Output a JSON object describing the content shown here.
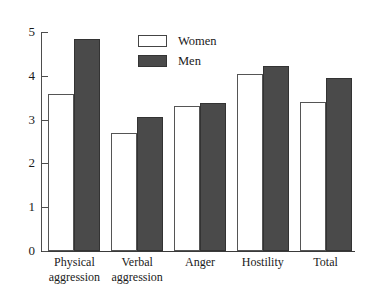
{
  "chart_data": {
    "type": "bar",
    "title": "",
    "xlabel": "",
    "ylabel": "",
    "ylim": [
      0,
      5
    ],
    "yticks": [
      "0",
      "1",
      "2",
      "3",
      "4",
      "5"
    ],
    "grid": false,
    "legend_position": "top-center",
    "categories": [
      "Physical aggression",
      "Verbal aggression",
      "Anger",
      "Hostility",
      "Total"
    ],
    "category_lines": [
      [
        "Physical",
        "aggression"
      ],
      [
        "Verbal",
        "aggression"
      ],
      [
        "Anger",
        ""
      ],
      [
        "Hostility",
        ""
      ],
      [
        "Total",
        ""
      ]
    ],
    "series": [
      {
        "name": "Women",
        "color": "#ffffff",
        "values": [
          3.59,
          2.7,
          3.32,
          4.05,
          3.41
        ]
      },
      {
        "name": "Men",
        "color": "#4a4a4a",
        "values": [
          4.84,
          3.05,
          3.39,
          4.23,
          3.95
        ]
      }
    ]
  },
  "axis_title_fragment": "c",
  "legend": {
    "items": [
      {
        "label": "Women"
      },
      {
        "label": "Men"
      }
    ]
  }
}
